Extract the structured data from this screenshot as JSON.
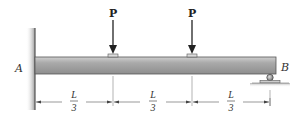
{
  "diagram": {
    "type": "beam-loading",
    "supports": {
      "left": {
        "label": "A",
        "type": "fixed-wall"
      },
      "right": {
        "label": "B",
        "type": "roller"
      }
    },
    "loads": [
      {
        "label": "P",
        "position": "L/3"
      },
      {
        "label": "P",
        "position": "2L/3"
      }
    ],
    "dimensions": [
      {
        "numerator": "L",
        "denominator": "3"
      },
      {
        "numerator": "L",
        "denominator": "3"
      },
      {
        "numerator": "L",
        "denominator": "3"
      }
    ],
    "colors": {
      "beam_top": "#d4d4d4",
      "beam_mid": "#a8a8a8",
      "beam_bottom": "#8a8a8a",
      "outline": "#333333",
      "dimension_line": "#555555"
    }
  }
}
